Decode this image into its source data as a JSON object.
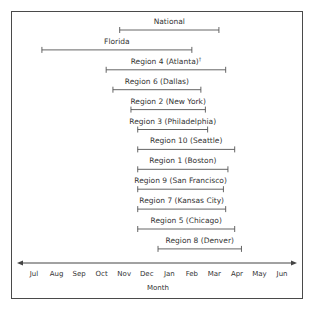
{
  "chart_data": {
    "type": "timeline-range",
    "title": "",
    "xlabel": "Month",
    "ylabel": "",
    "categories": [
      "Jul",
      "Aug",
      "Sep",
      "Oct",
      "Nov",
      "Dec",
      "Jan",
      "Feb",
      "Mar",
      "Apr",
      "May",
      "Jun"
    ],
    "note": "Values are month offsets from Jul (0=Jul ... 11=Jun), estimated from tick positions",
    "series": [
      {
        "name": "National",
        "start": 3.8,
        "end": 8.2
      },
      {
        "name": "Florida",
        "start": 0.35,
        "end": 7.0
      },
      {
        "name": "Region 4 (Atlanta)",
        "superscript": "†",
        "start": 3.2,
        "end": 8.5
      },
      {
        "name": "Region 6 (Dallas)",
        "start": 3.5,
        "end": 7.4
      },
      {
        "name": "Region 2 (New York)",
        "start": 4.3,
        "end": 7.6
      },
      {
        "name": "Region 3 (Philadelphia)",
        "start": 4.6,
        "end": 7.7
      },
      {
        "name": "Region 10 (Seattle)",
        "start": 4.6,
        "end": 8.9
      },
      {
        "name": "Region 1 (Boston)",
        "start": 4.6,
        "end": 8.6
      },
      {
        "name": "Region 9 (San Francisco)",
        "start": 4.6,
        "end": 8.4
      },
      {
        "name": "Region 7 (Kansas City)",
        "start": 4.6,
        "end": 8.5
      },
      {
        "name": "Region 5 (Chicago)",
        "start": 4.6,
        "end": 8.9
      },
      {
        "name": "Region 8 (Denver)",
        "start": 5.5,
        "end": 9.2
      }
    ],
    "xlim": [
      "Jul",
      "Jun"
    ],
    "grid": false,
    "legend": "none",
    "colors": {
      "line": "#555555",
      "text": "#333333",
      "frame": "#4a4a4a"
    }
  }
}
